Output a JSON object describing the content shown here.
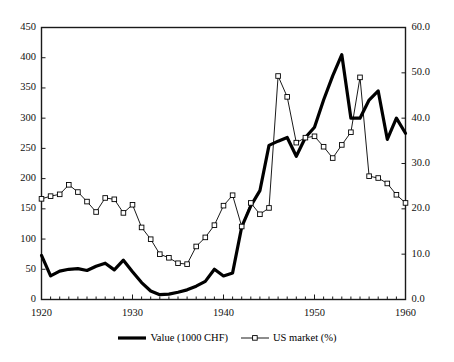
{
  "chart_data": {
    "type": "line",
    "title": "",
    "xlabel": "",
    "ylabel": "",
    "y2label": "",
    "grid": false,
    "legend_position": "bottom",
    "xlim": [
      1920,
      1960
    ],
    "ylim": [
      0,
      450
    ],
    "y2lim": [
      0.0,
      60.0
    ],
    "x_ticks": [
      1920,
      1930,
      1940,
      1950,
      1960
    ],
    "x_tick_labels": [
      "1920",
      "1930",
      "1940",
      "1950",
      "1960"
    ],
    "x_minor_tick_step": 1,
    "y_ticks": [
      0,
      50,
      100,
      150,
      200,
      250,
      300,
      350,
      400,
      450
    ],
    "y_tick_labels": [
      "0",
      "50",
      "100",
      "150",
      "200",
      "250",
      "300",
      "350",
      "400",
      "450"
    ],
    "y2_ticks": [
      0.0,
      10.0,
      20.0,
      30.0,
      40.0,
      50.0,
      60.0
    ],
    "y2_tick_labels": [
      "0.0",
      "10.0",
      "20.0",
      "30.0",
      "40.0",
      "50.0",
      "60.0"
    ],
    "x": [
      1920,
      1921,
      1922,
      1923,
      1924,
      1925,
      1926,
      1927,
      1928,
      1929,
      1930,
      1931,
      1932,
      1933,
      1934,
      1935,
      1936,
      1937,
      1938,
      1939,
      1940,
      1941,
      1942,
      1943,
      1944,
      1945,
      1946,
      1947,
      1948,
      1949,
      1950,
      1951,
      1952,
      1953,
      1954,
      1955,
      1956,
      1957,
      1958,
      1959,
      1960
    ],
    "series": [
      {
        "name": "Value (1000 CHF)",
        "axis": "left",
        "color": "#000000",
        "line_width": 3.2,
        "marker": "none",
        "values": [
          73,
          39,
          47,
          50,
          51,
          48,
          55,
          60,
          49,
          65,
          46,
          28,
          14,
          8,
          9,
          12,
          16,
          22,
          30,
          50,
          39,
          44,
          120,
          155,
          180,
          255,
          262,
          268,
          237,
          268,
          285,
          330,
          370,
          405,
          300,
          300,
          330,
          345,
          265,
          300,
          275
        ]
      },
      {
        "name": "US market (%)",
        "axis": "right",
        "color": "#000000",
        "line_width": 0.9,
        "marker": "open-square",
        "values": [
          22.2,
          22.8,
          23.2,
          25.3,
          23.7,
          21.6,
          19.3,
          22.4,
          22.1,
          19.1,
          20.9,
          15.9,
          13.3,
          10.0,
          9.2,
          8.0,
          7.8,
          11.7,
          13.7,
          16.4,
          20.7,
          23.0,
          16.1,
          21.3,
          18.8,
          20.2,
          49.3,
          44.7,
          34.6,
          35.7,
          36.0,
          33.7,
          31.2,
          34.1,
          36.9,
          49.0,
          27.2,
          26.8,
          25.6,
          23.1,
          21.3
        ]
      }
    ]
  },
  "legend": {
    "items": [
      {
        "label": "Value (1000 CHF)",
        "style": "thick-line"
      },
      {
        "label": "US market (%)",
        "style": "thin-line-square-marker"
      }
    ]
  }
}
